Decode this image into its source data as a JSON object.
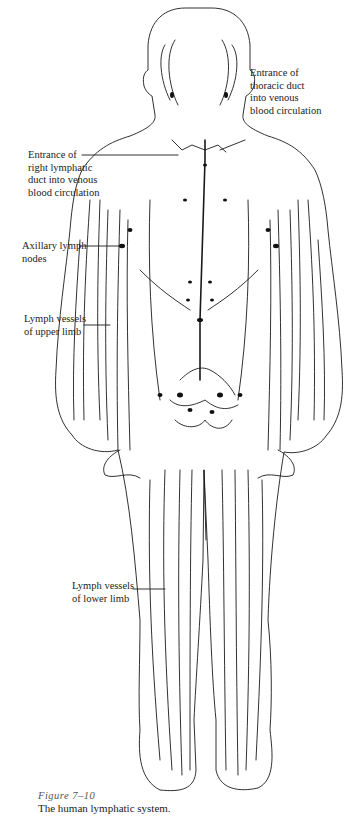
{
  "figure": {
    "number": "Figure 7–10",
    "caption": "The human lymphatic system.",
    "colors": {
      "ink": "#1a1a1a",
      "background": "#ffffff",
      "caption_number": "#555555"
    }
  },
  "labels": {
    "thoracic_duct": "Entrance of\nthoracic duct\ninto venous\nblood circulation",
    "right_lymphatic_duct": "Entrance of\nright lymphatic\nduct into venous\nblood circulation",
    "axillary_nodes": "Axillary lymph\nnodes",
    "upper_limb": "Lymph vessels\nof upper limb",
    "lower_limb": "Lymph vessels\nof lower limb"
  }
}
